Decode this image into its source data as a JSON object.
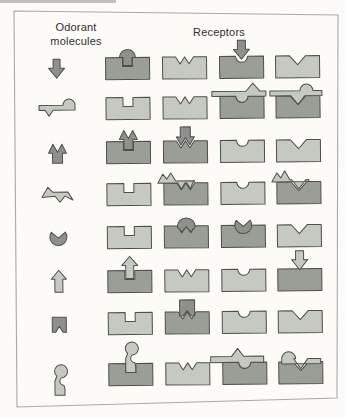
{
  "figure": {
    "header": {
      "left_label": "Odorant molecules",
      "right_label": "Receptors"
    },
    "palette": {
      "background": "#fcfbf8",
      "frame_border": "#a9a9a9",
      "outline": "#4e4e4a",
      "receptor_light": "#c6c9c2",
      "receptor_dark": "#9b9e97",
      "molecule_dark": "#8d908b",
      "molecule_light": "#c6c9c2"
    },
    "rows": [
      {
        "molecule": {
          "name": "arrow-down",
          "tone": "dark"
        },
        "receptors": [
          {
            "notch": "slot",
            "tone": "dark",
            "bound": true,
            "overlay": "arrow-plug-in-slot"
          },
          {
            "notch": "double-v",
            "tone": "light",
            "bound": false
          },
          {
            "notch": "round",
            "tone": "dark",
            "bound": true,
            "overlay": "arrow-down-above-round"
          },
          {
            "notch": "v",
            "tone": "light",
            "bound": false
          }
        ]
      },
      {
        "molecule": {
          "name": "bar-hook",
          "tone": "light"
        },
        "receptors": [
          {
            "notch": "slot",
            "tone": "light",
            "bound": false
          },
          {
            "notch": "double-v",
            "tone": "light",
            "bound": false
          },
          {
            "notch": "round",
            "tone": "dark",
            "bound": true,
            "overlay": "bar-dome-peak"
          },
          {
            "notch": "v",
            "tone": "dark",
            "bound": true,
            "overlay": "bar-tooth-dome"
          }
        ]
      },
      {
        "molecule": {
          "name": "double-arrow-up",
          "tone": "dark"
        },
        "receptors": [
          {
            "notch": "slot",
            "tone": "dark",
            "bound": true,
            "overlay": "double-arrow-in-slot"
          },
          {
            "notch": "double-v",
            "tone": "dark",
            "bound": true,
            "overlay": "double-arrow-on-w"
          },
          {
            "notch": "round",
            "tone": "light",
            "bound": false
          },
          {
            "notch": "v",
            "tone": "light",
            "bound": false
          }
        ]
      },
      {
        "molecule": {
          "name": "zigzag",
          "tone": "light"
        },
        "receptors": [
          {
            "notch": "slot",
            "tone": "light",
            "bound": false
          },
          {
            "notch": "double-v",
            "tone": "dark",
            "bound": true,
            "overlay": "zigzag-on-w"
          },
          {
            "notch": "round",
            "tone": "light",
            "bound": false
          },
          {
            "notch": "v",
            "tone": "dark",
            "bound": true,
            "overlay": "zigzag-on-v"
          }
        ]
      },
      {
        "molecule": {
          "name": "crown-blob",
          "tone": "dark"
        },
        "receptors": [
          {
            "notch": "slot",
            "tone": "light",
            "bound": false
          },
          {
            "notch": "double-v",
            "tone": "dark",
            "bound": true,
            "overlay": "blob-in-w"
          },
          {
            "notch": "round",
            "tone": "dark",
            "bound": true,
            "overlay": "crown-in-round"
          },
          {
            "notch": "v",
            "tone": "light",
            "bound": false
          }
        ]
      },
      {
        "molecule": {
          "name": "arrow-up",
          "tone": "light"
        },
        "receptors": [
          {
            "notch": "slot",
            "tone": "dark",
            "bound": true,
            "overlay": "arrow-up-in-slot"
          },
          {
            "notch": "double-v",
            "tone": "light",
            "bound": false
          },
          {
            "notch": "round",
            "tone": "light",
            "bound": false
          },
          {
            "notch": "flat",
            "tone": "dark",
            "bound": true,
            "overlay": "arrow-down-above"
          }
        ]
      },
      {
        "molecule": {
          "name": "notched-square",
          "tone": "dark"
        },
        "receptors": [
          {
            "notch": "slot",
            "tone": "light",
            "bound": false
          },
          {
            "notch": "double-v",
            "tone": "dark",
            "bound": true,
            "overlay": "square-on-w"
          },
          {
            "notch": "round",
            "tone": "light",
            "bound": false
          },
          {
            "notch": "v",
            "tone": "light",
            "bound": false
          }
        ]
      },
      {
        "molecule": {
          "name": "s-curve",
          "tone": "light"
        },
        "receptors": [
          {
            "notch": "slot",
            "tone": "dark",
            "bound": true,
            "overlay": "s-curve-in-slot"
          },
          {
            "notch": "double-v",
            "tone": "light",
            "bound": false
          },
          {
            "notch": "round",
            "tone": "dark",
            "bound": true,
            "overlay": "bar-peak-dome"
          },
          {
            "notch": "v",
            "tone": "dark",
            "bound": true,
            "overlay": "dome-wave-in-v"
          }
        ]
      }
    ]
  }
}
